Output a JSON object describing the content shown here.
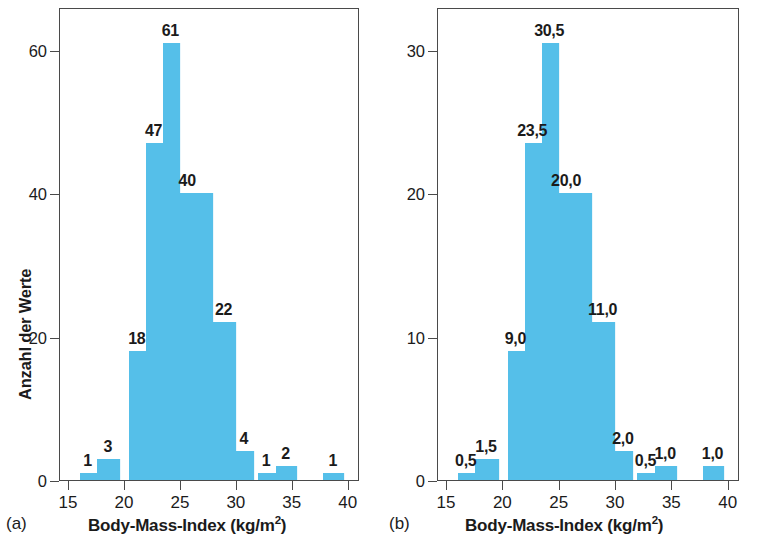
{
  "figure": {
    "bar_color": "#55bfe9",
    "axis_color": "#4a4a4a",
    "text_color": "#1b1b1b"
  },
  "panel_a": {
    "tag": "(a)",
    "ylabel": "Anzahl der Werte",
    "xlabel_main": "Body-Mass-Index (kg/m",
    "xlabel_exp": "2",
    "xlabel_close": ")",
    "yticks": [
      "0",
      "20",
      "40",
      "60"
    ],
    "ytick_values": [
      0,
      20,
      40,
      60
    ],
    "xticks": [
      "15",
      "20",
      "25",
      "30",
      "35",
      "40"
    ],
    "xtick_values": [
      15,
      20,
      25,
      30,
      35,
      40
    ]
  },
  "panel_b": {
    "tag": "(b)",
    "ylabel": "Prozent aller Werte",
    "xlabel_main": "Body-Mass-Index (kg/m",
    "xlabel_exp": "2",
    "xlabel_close": ")",
    "yticks": [
      "0",
      "10",
      "20",
      "30"
    ],
    "ytick_values": [
      0,
      10,
      20,
      30
    ],
    "xticks": [
      "15",
      "20",
      "25",
      "30",
      "35",
      "40"
    ],
    "xtick_values": [
      15,
      20,
      25,
      30,
      35,
      40
    ]
  },
  "chart_data": [
    {
      "type": "bar",
      "panel": "(a)",
      "title": "",
      "xlabel": "Body-Mass-Index (kg/m2)",
      "ylabel": "Anzahl der Werte",
      "xlim": [
        14.2,
        41.0
      ],
      "ylim": [
        0,
        66
      ],
      "grid": false,
      "legend": "none",
      "bin_width": 1.5,
      "bin_starts": [
        16.0,
        17.5,
        20.5,
        22.0,
        23.5,
        25.0,
        26.5,
        28.0,
        29.5,
        31.0,
        32.5,
        34.0,
        38.0
      ],
      "bin_labels": [
        "1",
        "3",
        "18",
        "47",
        "61",
        "40",
        "22",
        "",
        "",
        "4",
        "1",
        "2",
        "1"
      ],
      "values": [
        1,
        3,
        18,
        47,
        61,
        40,
        22,
        22,
        22,
        4,
        1,
        2,
        1
      ],
      "data_labels": [
        "1",
        "3",
        "18",
        "47",
        "61",
        "40",
        "22",
        "4",
        "1",
        "2",
        "1"
      ],
      "bars": [
        {
          "x_start": 16.0,
          "x_end": 17.5,
          "value": 1,
          "label": "1"
        },
        {
          "x_start": 17.5,
          "x_end": 19.6,
          "value": 3,
          "label": "3"
        },
        {
          "x_start": 20.4,
          "x_end": 21.9,
          "value": 18,
          "label": "18"
        },
        {
          "x_start": 21.9,
          "x_end": 23.4,
          "value": 47,
          "label": "47"
        },
        {
          "x_start": 23.4,
          "x_end": 24.9,
          "value": 61,
          "label": "61"
        },
        {
          "x_start": 24.9,
          "x_end": 26.4,
          "value": 40,
          "label": "40"
        },
        {
          "x_start": 26.4,
          "x_end": 27.9,
          "value": 40,
          "label": ""
        },
        {
          "x_start": 27.9,
          "x_end": 29.9,
          "value": 22,
          "label": "22"
        },
        {
          "x_start": 29.9,
          "x_end": 31.5,
          "value": 4,
          "label": "4"
        },
        {
          "x_start": 31.9,
          "x_end": 33.5,
          "value": 1,
          "label": "1"
        },
        {
          "x_start": 33.5,
          "x_end": 35.4,
          "value": 2,
          "label": "2"
        },
        {
          "x_start": 37.7,
          "x_end": 39.6,
          "value": 1,
          "label": "1"
        }
      ]
    },
    {
      "type": "bar",
      "panel": "(b)",
      "title": "",
      "xlabel": "Body-Mass-Index (kg/m2)",
      "ylabel": "Prozent aller Werte",
      "xlim": [
        14.2,
        41.0
      ],
      "ylim": [
        0,
        33
      ],
      "grid": false,
      "legend": "none",
      "bin_width": 1.5,
      "data_labels": [
        "0,5",
        "1,5",
        "9,0",
        "23,5",
        "30,5",
        "20,0",
        "11,0",
        "2,0",
        "0,5",
        "1,0",
        "1,0"
      ],
      "bars": [
        {
          "x_start": 16.0,
          "x_end": 17.5,
          "value": 0.5,
          "label": "0,5"
        },
        {
          "x_start": 17.5,
          "x_end": 19.6,
          "value": 1.5,
          "label": "1,5"
        },
        {
          "x_start": 20.4,
          "x_end": 21.9,
          "value": 9.0,
          "label": "9,0"
        },
        {
          "x_start": 21.9,
          "x_end": 23.4,
          "value": 23.5,
          "label": "23,5"
        },
        {
          "x_start": 23.4,
          "x_end": 24.9,
          "value": 30.5,
          "label": "30,5"
        },
        {
          "x_start": 24.9,
          "x_end": 26.4,
          "value": 20.0,
          "label": "20,0"
        },
        {
          "x_start": 26.4,
          "x_end": 27.9,
          "value": 20.0,
          "label": ""
        },
        {
          "x_start": 27.9,
          "x_end": 29.9,
          "value": 11.0,
          "label": "11,0"
        },
        {
          "x_start": 29.9,
          "x_end": 31.5,
          "value": 2.0,
          "label": "2,0"
        },
        {
          "x_start": 31.9,
          "x_end": 33.5,
          "value": 0.5,
          "label": "0,5"
        },
        {
          "x_start": 33.5,
          "x_end": 35.4,
          "value": 1.0,
          "label": "1,0"
        },
        {
          "x_start": 37.7,
          "x_end": 39.6,
          "value": 1.0,
          "label": "1,0"
        }
      ]
    }
  ]
}
